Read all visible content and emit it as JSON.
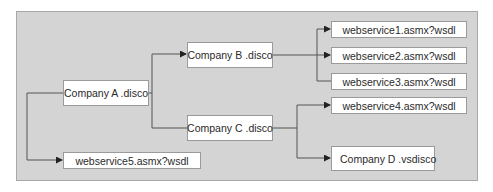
{
  "diagram": {
    "type": "hierarchy",
    "nodes": {
      "company_a": "Company A .disco",
      "company_b": "Company B .disco",
      "company_c": "Company C .disco",
      "company_d": "Company D .vsdisco",
      "ws1": "webservice1.asmx?wsdl",
      "ws2": "webservice2.asmx?wsdl",
      "ws3": "webservice3.asmx?wsdl",
      "ws4": "webservice4.asmx?wsdl",
      "ws5": "webservice5.asmx?wsdl"
    },
    "edges": [
      {
        "from": "Company A .disco",
        "to": "Company B .disco"
      },
      {
        "from": "Company A .disco",
        "to": "Company C .disco"
      },
      {
        "from": "Company A .disco",
        "to": "webservice5.asmx?wsdl"
      },
      {
        "from": "Company B .disco",
        "to": "webservice1.asmx?wsdl"
      },
      {
        "from": "Company B .disco",
        "to": "webservice2.asmx?wsdl"
      },
      {
        "from": "Company B .disco",
        "to": "webservice3.asmx?wsdl"
      },
      {
        "from": "Company C .disco",
        "to": "webservice4.asmx?wsdl"
      },
      {
        "from": "Company C .disco",
        "to": "Company D .vsdisco"
      }
    ],
    "colors": {
      "panel": "#d4d4d4",
      "node_fill": "#ffffff",
      "line": "#555555"
    }
  }
}
